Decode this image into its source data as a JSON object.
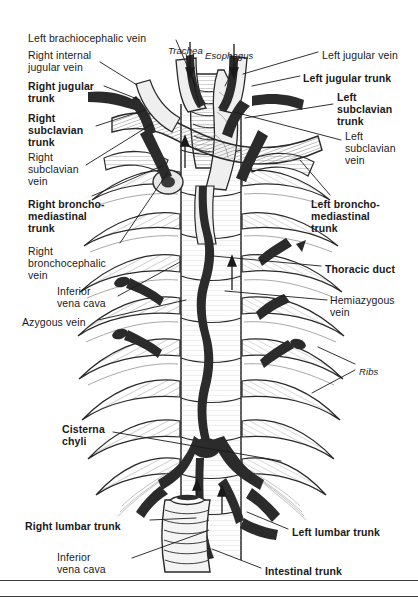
{
  "figure": {
    "style": {
      "background": "#ffffff",
      "ink": "#111111",
      "vessel_dark": "#2b2b2b",
      "vessel_mid": "#555555",
      "bone_light": "#f2f2f2",
      "hatch": "#777777",
      "leader": "#1a1a1a",
      "rule": "#3a3a3a"
    },
    "rules": [
      {
        "name": "bottom-rule-upper",
        "y": 580
      },
      {
        "name": "bottom-rule-lower",
        "y": 596
      }
    ]
  },
  "labels": {
    "left": [
      {
        "id": "left-brachiocephalic-vein",
        "text": "Left brachiocephalic vein",
        "bold": false,
        "x": 28,
        "y": 33,
        "align": "left"
      },
      {
        "id": "right-internal-jugular-vein",
        "text": "Right internal\njugular vein",
        "bold": false,
        "x": 28,
        "y": 50,
        "align": "left"
      },
      {
        "id": "right-jugular-trunk",
        "text": "Right jugular\ntrunk",
        "bold": true,
        "x": 28,
        "y": 81,
        "align": "left"
      },
      {
        "id": "right-subclavian-trunk",
        "text": "Right\nsubclavian\ntrunk",
        "bold": true,
        "x": 28,
        "y": 113,
        "align": "left"
      },
      {
        "id": "right-subclavian-vein",
        "text": "Right\nsubclavian\nvein",
        "bold": false,
        "x": 28,
        "y": 152,
        "align": "left"
      },
      {
        "id": "right-bronchomediastinal-trunk",
        "text": "Right broncho-\nmediastinal\ntrunk",
        "bold": true,
        "x": 28,
        "y": 199,
        "align": "left"
      },
      {
        "id": "right-bronchocephalic-vein",
        "text": "Right\nbronchocephalic\nvein",
        "bold": false,
        "x": 28,
        "y": 246,
        "align": "left"
      },
      {
        "id": "inferior-vena-cava-upper",
        "text": "Inferior\nvena cava",
        "bold": false,
        "x": 57,
        "y": 286,
        "align": "left"
      },
      {
        "id": "azygous-vein",
        "text": "Azygous vein",
        "bold": false,
        "x": 22,
        "y": 317,
        "align": "left"
      },
      {
        "id": "cisterna-chyli",
        "text": "Cisterna\nchyli",
        "bold": true,
        "x": 62,
        "y": 424,
        "align": "left"
      },
      {
        "id": "right-lumbar-trunk",
        "text": "Right lumbar trunk",
        "bold": true,
        "x": 25,
        "y": 521,
        "align": "left"
      },
      {
        "id": "inferior-vena-cava-lower",
        "text": "Inferior\nvena cava",
        "bold": false,
        "x": 57,
        "y": 552,
        "align": "left"
      }
    ],
    "right": [
      {
        "id": "left-jugular-vein",
        "text": "Left jugular vein",
        "bold": false,
        "x": 322,
        "y": 50,
        "align": "left"
      },
      {
        "id": "left-jugular-trunk",
        "text": "Left jugular trunk",
        "bold": true,
        "x": 303,
        "y": 73,
        "align": "left"
      },
      {
        "id": "left-subclavian-trunk",
        "text": "Left\nsubclavian\ntrunk",
        "bold": true,
        "x": 337,
        "y": 92,
        "align": "left"
      },
      {
        "id": "left-subclavian-vein",
        "text": "Left\nsubclavian\nvein",
        "bold": false,
        "x": 345,
        "y": 131,
        "align": "left"
      },
      {
        "id": "left-bronchomediastinal-trunk",
        "text": "Left broncho-\nmediastinal\ntrunk",
        "bold": true,
        "x": 311,
        "y": 199,
        "align": "left"
      },
      {
        "id": "thoracic-duct",
        "text": "Thoracic duct",
        "bold": true,
        "x": 325,
        "y": 264,
        "align": "left"
      },
      {
        "id": "hemiazygous-vein",
        "text": "Hemiazygous\nvein",
        "bold": false,
        "x": 330,
        "y": 295,
        "align": "left"
      },
      {
        "id": "ribs",
        "text": "Ribs",
        "bold": false,
        "italic": true,
        "x": 359,
        "y": 366,
        "align": "left"
      },
      {
        "id": "left-lumbar-trunk",
        "text": "Left lumbar trunk",
        "bold": true,
        "x": 292,
        "y": 527,
        "align": "left"
      },
      {
        "id": "intestinal-trunk",
        "text": "Intestinal trunk",
        "bold": true,
        "x": 265,
        "y": 566,
        "align": "left"
      }
    ],
    "inner": [
      {
        "id": "trachea",
        "text": "Trachea",
        "bold": false,
        "italic": true,
        "x": 168,
        "y": 45,
        "align": "left"
      },
      {
        "id": "esophagus",
        "text": "Esophagus",
        "bold": false,
        "italic": true,
        "x": 205,
        "y": 50,
        "align": "left"
      }
    ]
  },
  "leaders": [
    {
      "id": "leader-left-brachiocephalic-vein",
      "points": "176,40 196,86"
    },
    {
      "id": "leader-right-internal-jugular-vein",
      "points": "100,62 137,85"
    },
    {
      "id": "leader-right-jugular-trunk",
      "points": "104,86 140,100"
    },
    {
      "id": "leader-right-subclavian-trunk",
      "points": "96,126 145,110"
    },
    {
      "id": "leader-right-subclavian-vein",
      "points": "86,165 152,124"
    },
    {
      "id": "leader-right-bronchomediastinal-trunk",
      "points": "92,196 162,166"
    },
    {
      "id": "leader-right-bronchocephalic-vein",
      "points": "120,243 168,172"
    },
    {
      "id": "leader-inferior-vena-cava-upper",
      "points": "118,296 180,262"
    },
    {
      "id": "leader-azygous-vein",
      "points": "98,320 186,300"
    },
    {
      "id": "leader-cisterna-chyli",
      "points": "113,432 281,461"
    },
    {
      "id": "leader-right-lumbar-trunk",
      "points": "150,520 196,518"
    },
    {
      "id": "leader-inferior-vena-cava-lower",
      "points": "132,558 207,531"
    },
    {
      "id": "leader-left-jugular-vein",
      "points": "318,52 243,74"
    },
    {
      "id": "leader-left-jugular-trunk",
      "points": "300,76 252,86"
    },
    {
      "id": "leader-left-subclavian-trunk",
      "points": "333,104 245,118"
    },
    {
      "id": "leader-left-subclavian-vein",
      "points": "341,140 234,112"
    },
    {
      "id": "leader-left-bronchomediastinal-trunk",
      "points": "330,195 300,160"
    },
    {
      "id": "leader-thoracic-duct",
      "points": "321,266 213,256"
    },
    {
      "id": "leader-hemiazygous-vein",
      "points": "327,300 225,291"
    },
    {
      "id": "leader-ribs-upper",
      "points": "355,364 318,347"
    },
    {
      "id": "leader-ribs-lower",
      "points": "355,370 312,393"
    },
    {
      "id": "leader-left-lumbar-trunk",
      "points": "288,529 247,512"
    },
    {
      "id": "leader-intestinal-trunk",
      "points": "261,568 212,549"
    },
    {
      "id": "leader-trachea",
      "points": "186,54 200,108"
    },
    {
      "id": "leader-esophagus",
      "points": "240,56 225,86"
    }
  ],
  "diagram_content": {
    "type": "anatomical-illustration",
    "view": "anterior view of posterior thoracic wall and mediastinum",
    "structures_lymphatic": [
      "Right jugular trunk",
      "Left jugular trunk",
      "Right subclavian trunk",
      "Left subclavian trunk",
      "Right bronchomediastinal trunk",
      "Left bronchomediastinal trunk",
      "Thoracic duct",
      "Cisterna chyli",
      "Right lumbar trunk",
      "Left lumbar trunk",
      "Intestinal trunk"
    ],
    "structures_venous": [
      "Left brachiocephalic vein",
      "Right internal jugular vein",
      "Left jugular vein",
      "Right subclavian vein",
      "Left subclavian vein",
      "Right bronchocephalic vein",
      "Inferior vena cava",
      "Azygous vein",
      "Hemiazygous vein"
    ],
    "structures_other": [
      "Trachea",
      "Esophagus",
      "Ribs",
      "Vertebral column"
    ],
    "rib_pairs": 11,
    "flow_arrows": 5
  }
}
